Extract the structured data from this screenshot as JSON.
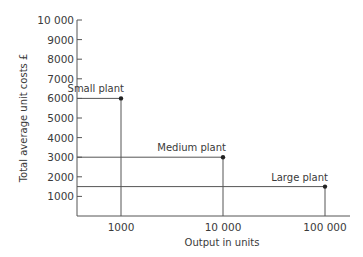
{
  "chart_data": {
    "type": "scatter",
    "title": "",
    "xlabel": "Output in units",
    "ylabel": "Total average unit costs £",
    "x_scale": "log",
    "x_ticks": [
      "1000",
      "10 000",
      "100 000"
    ],
    "y_ticks": [
      "1000",
      "2000",
      "3000",
      "4000",
      "5000",
      "6000",
      "7000",
      "8000",
      "9000",
      "10 000"
    ],
    "ylim": [
      0,
      10000
    ],
    "grid": false,
    "legend": null,
    "points": [
      {
        "label": "Small plant",
        "x": 1000,
        "y": 6000
      },
      {
        "label": "Medium plant",
        "x": 10000,
        "y": 3000
      },
      {
        "label": "Large plant",
        "x": 100000,
        "y": 1500
      }
    ],
    "annotations": [
      "Small plant",
      "Medium plant",
      "Large plant"
    ],
    "style": {
      "line_color": "#555555",
      "point_color": "#222222"
    }
  }
}
